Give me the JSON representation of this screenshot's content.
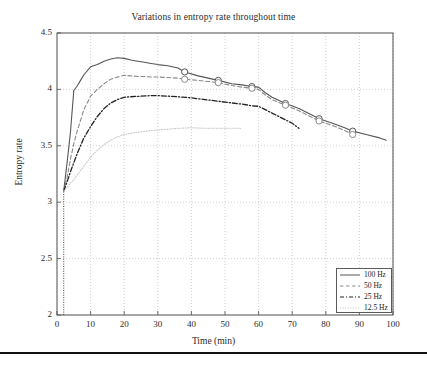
{
  "chart_data": {
    "type": "line",
    "title": "Variations in entropy rate throughout time",
    "xlabel": "Time (min)",
    "ylabel": "Entropy rate",
    "xlim": [
      0,
      100
    ],
    "ylim": [
      2,
      4.5
    ],
    "xticks": [
      0,
      10,
      20,
      30,
      40,
      50,
      60,
      70,
      80,
      90,
      100
    ],
    "yticks": [
      2,
      2.5,
      3,
      3.5,
      4,
      4.5
    ],
    "xtick_labels": [
      "0",
      "10",
      "20",
      "30",
      "40",
      "50",
      "60",
      "70",
      "80",
      "90",
      "100"
    ],
    "ytick_labels": [
      "2",
      "2.5",
      "3",
      "3.5",
      "4",
      "4.5"
    ],
    "grid": true,
    "grid_style": "dotted",
    "legend_position": "lower right",
    "series": [
      {
        "name": "100 Hz",
        "style": "solid",
        "color": "#555555",
        "markers": "circle",
        "marker_x": [
          38,
          48,
          58,
          68,
          78,
          88
        ],
        "marker_y": [
          4.155,
          4.08,
          4.025,
          3.875,
          3.74,
          3.63
        ],
        "x": [
          2,
          3,
          4,
          5,
          6,
          7,
          8,
          10,
          12,
          14,
          16,
          18,
          20,
          22,
          24,
          26,
          28,
          30,
          33,
          36,
          38,
          42,
          45,
          48,
          52,
          55,
          58,
          60,
          62,
          64,
          68,
          72,
          76,
          78,
          82,
          86,
          88,
          92,
          96,
          98
        ],
        "y": [
          3.1,
          3.35,
          3.62,
          3.99,
          4.03,
          4.08,
          4.13,
          4.2,
          4.22,
          4.25,
          4.27,
          4.28,
          4.275,
          4.26,
          4.25,
          4.24,
          4.23,
          4.22,
          4.21,
          4.19,
          4.155,
          4.12,
          4.1,
          4.08,
          4.05,
          4.04,
          4.025,
          4.02,
          3.97,
          3.93,
          3.875,
          3.83,
          3.77,
          3.74,
          3.7,
          3.655,
          3.63,
          3.6,
          3.57,
          3.55
        ]
      },
      {
        "name": "50 Hz",
        "style": "dashed",
        "color": "#8a8a8a",
        "markers": "circle",
        "marker_x": [
          38,
          48,
          58,
          68,
          78,
          88
        ],
        "marker_y": [
          4.09,
          4.06,
          4.01,
          3.86,
          3.72,
          3.6
        ],
        "x": [
          2,
          3,
          4,
          5,
          6,
          8,
          10,
          12,
          14,
          16,
          18,
          20,
          22,
          24,
          26,
          28,
          30,
          33,
          36,
          38,
          42,
          45,
          48,
          52,
          55,
          58,
          60,
          62,
          64,
          68,
          72,
          76,
          78,
          82,
          86,
          88
        ],
        "y": [
          3.1,
          3.22,
          3.38,
          3.52,
          3.63,
          3.82,
          3.94,
          4.0,
          4.05,
          4.09,
          4.11,
          4.125,
          4.12,
          4.115,
          4.115,
          4.11,
          4.11,
          4.105,
          4.1,
          4.09,
          4.08,
          4.07,
          4.06,
          4.035,
          4.02,
          4.01,
          4.0,
          3.95,
          3.91,
          3.86,
          3.81,
          3.75,
          3.72,
          3.68,
          3.63,
          3.6
        ]
      },
      {
        "name": "25 Hz",
        "style": "dashdot",
        "color": "#222222",
        "markers": "none",
        "marker_x": [],
        "marker_y": [],
        "x": [
          2,
          3,
          4,
          5,
          6,
          8,
          10,
          12,
          14,
          16,
          18,
          20,
          22,
          25,
          28,
          30,
          33,
          36,
          40,
          44,
          48,
          52,
          55,
          58,
          60,
          62,
          64,
          66,
          68,
          70,
          72
        ],
        "y": [
          3.1,
          3.18,
          3.27,
          3.35,
          3.43,
          3.57,
          3.67,
          3.76,
          3.83,
          3.88,
          3.91,
          3.93,
          3.935,
          3.94,
          3.945,
          3.945,
          3.94,
          3.935,
          3.925,
          3.91,
          3.895,
          3.88,
          3.87,
          3.855,
          3.85,
          3.82,
          3.79,
          3.76,
          3.73,
          3.7,
          3.655
        ]
      },
      {
        "name": "12.5 Hz",
        "style": "dotted",
        "color": "#c9c9c9",
        "markers": "none",
        "marker_x": [],
        "marker_y": [],
        "x": [
          2,
          3,
          4,
          5,
          6,
          8,
          10,
          12,
          14,
          16,
          18,
          20,
          24,
          28,
          32,
          36,
          40,
          44,
          48,
          52,
          55
        ],
        "y": [
          3.1,
          3.13,
          3.17,
          3.2,
          3.24,
          3.32,
          3.4,
          3.46,
          3.51,
          3.55,
          3.58,
          3.6,
          3.62,
          3.635,
          3.645,
          3.655,
          3.66,
          3.655,
          3.655,
          3.655,
          3.655
        ]
      }
    ],
    "axis_marker_line": {
      "description": "dotted vertical segment at x=2 rising from y=2",
      "x": 2,
      "y_from": 2,
      "y_to": 3.1
    }
  },
  "legend": {
    "entries": [
      {
        "label": "100 Hz"
      },
      {
        "label": "50 Hz"
      },
      {
        "label": "25 Hz"
      },
      {
        "label": "12.5 Hz"
      }
    ]
  },
  "colors": {
    "axis": "#4d4d4d",
    "grid": "#bdbdbd",
    "text": "#2b2b2b",
    "rule": "#111111"
  }
}
